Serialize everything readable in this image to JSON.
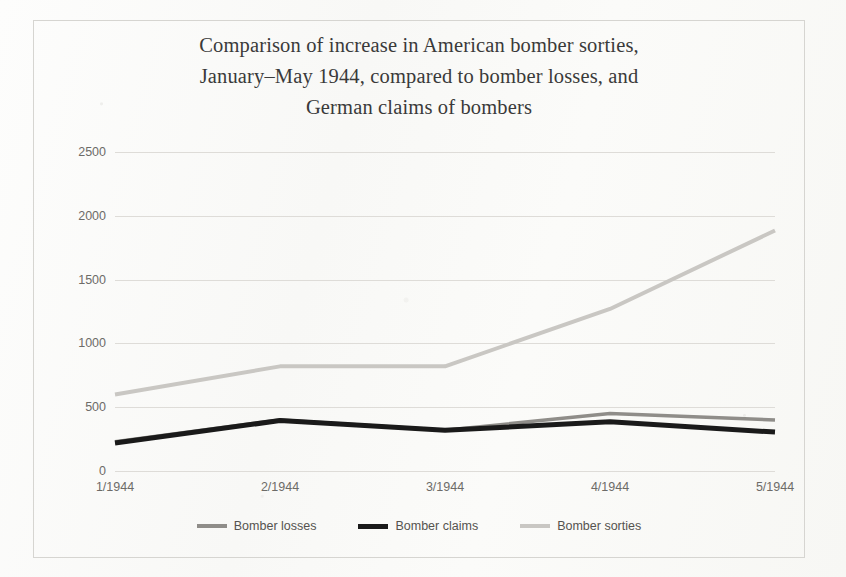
{
  "chart_data": {
    "type": "line",
    "title": "Comparison of increase in American bomber sorties, January–May 1944, compared to bomber losses, and German claims of bombers",
    "title_lines": [
      "Comparison of increase in American bomber sorties,",
      "January–May 1944, compared to bomber losses, and",
      "German claims of bombers"
    ],
    "subtitle": "",
    "xlabel": "",
    "ylabel": "",
    "categories": [
      "1/1944",
      "2/1944",
      "3/1944",
      "4/1944",
      "5/1944"
    ],
    "ylim": [
      0,
      2500
    ],
    "yticks": [
      0,
      500,
      1000,
      1500,
      2000,
      2500
    ],
    "ytick_labels": [
      "0",
      "500",
      "1000",
      "1500",
      "2000",
      "2500"
    ],
    "grid": true,
    "legend_position": "bottom",
    "series": [
      {
        "name": "Bomber losses",
        "color": "#8f8d89",
        "width": 3.5,
        "values": [
          230,
          400,
          320,
          450,
          400
        ]
      },
      {
        "name": "Bomber claims",
        "color": "#1a1a1a",
        "width": 5,
        "values": [
          220,
          395,
          320,
          385,
          305
        ]
      },
      {
        "name": "Bomber sorties",
        "color": "#c9c7c3",
        "width": 4,
        "values": [
          600,
          820,
          820,
          1270,
          1885
        ]
      }
    ]
  },
  "legend": {
    "items": [
      {
        "label": "Bomber losses",
        "color": "#8f8d89"
      },
      {
        "label": "Bomber claims",
        "color": "#1a1a1a"
      },
      {
        "label": "Bomber sorties",
        "color": "#c9c7c3"
      }
    ]
  },
  "colors": {
    "page_background": "#fcfcfb",
    "frame_border": "#d6d5d1",
    "gridline": "#dedcd8",
    "axis_text": "#6d6b68",
    "title_text": "#3a3a3a"
  }
}
